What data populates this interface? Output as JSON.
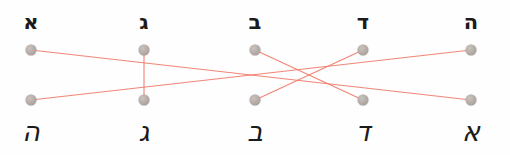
{
  "exercise": {
    "type": "matching-exercise",
    "title": "Hebrew letter matching: print forms to cursive forms",
    "width": 510,
    "height": 155,
    "background_color": "#fefefe",
    "line_color": "#ef7b6a",
    "dot_color": "#b3aaa5",
    "text_color": "#1d1b1a"
  },
  "top_row": {
    "label": "Hebrew print letters",
    "y_letter": 22,
    "y_dot": 50,
    "items": [
      {
        "id": "top-1",
        "glyph": "א",
        "name": "alef",
        "x": 31
      },
      {
        "id": "top-2",
        "glyph": "ג",
        "name": "gimel",
        "x": 144
      },
      {
        "id": "top-3",
        "glyph": "ב",
        "name": "bet",
        "x": 255
      },
      {
        "id": "top-4",
        "glyph": "ד",
        "name": "dalet",
        "x": 363
      },
      {
        "id": "top-5",
        "glyph": "ה",
        "name": "he",
        "x": 471
      }
    ]
  },
  "bottom_row": {
    "label": "Hebrew cursive letters",
    "y_letter": 131,
    "y_dot": 100,
    "items": [
      {
        "id": "bot-1",
        "glyph": "ה",
        "name": "he-cursive",
        "x": 31
      },
      {
        "id": "bot-2",
        "glyph": "ג",
        "name": "gimel-cursive",
        "x": 144
      },
      {
        "id": "bot-3",
        "glyph": "ב",
        "name": "bet-cursive",
        "x": 255
      },
      {
        "id": "bot-4",
        "glyph": "ד",
        "name": "dalet-cursive",
        "x": 363
      },
      {
        "id": "bot-5",
        "glyph": "א",
        "name": "alef-cursive",
        "x": 471
      }
    ]
  },
  "connections": [
    {
      "id": "edge-1",
      "from": "top-1",
      "to": "bot-5",
      "from_x": 31,
      "from_y": 50,
      "to_x": 471,
      "to_y": 100
    },
    {
      "id": "edge-2",
      "from": "top-2",
      "to": "bot-2",
      "from_x": 144,
      "from_y": 50,
      "to_x": 144,
      "to_y": 100
    },
    {
      "id": "edge-3",
      "from": "top-3",
      "to": "bot-4",
      "from_x": 255,
      "from_y": 50,
      "to_x": 363,
      "to_y": 100
    },
    {
      "id": "edge-4",
      "from": "top-4",
      "to": "bot-3",
      "from_x": 363,
      "from_y": 50,
      "to_x": 255,
      "to_y": 100
    },
    {
      "id": "edge-5",
      "from": "top-5",
      "to": "bot-1",
      "from_x": 471,
      "from_y": 50,
      "to_x": 31,
      "to_y": 100
    }
  ]
}
